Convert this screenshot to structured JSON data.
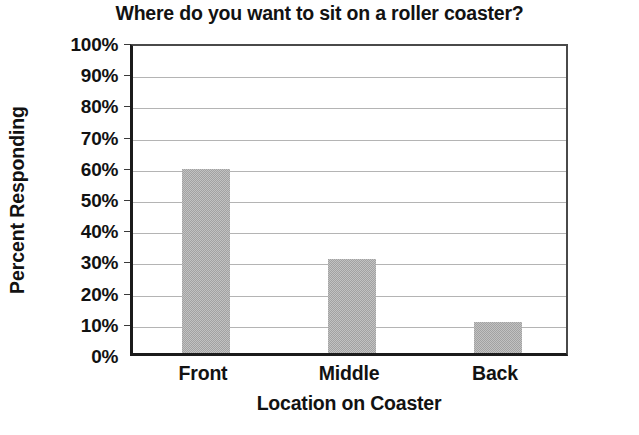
{
  "chart_data": {
    "type": "bar",
    "title": "Where do you want to sit on a roller coaster?",
    "xlabel": "Location on Coaster",
    "ylabel": "Percent Responding",
    "categories": [
      "Front",
      "Middle",
      "Back"
    ],
    "values": [
      59,
      30,
      10
    ],
    "value_labels": [
      "59%",
      "30%",
      "10%"
    ],
    "ylim": [
      0,
      100
    ],
    "ytick_step": 10,
    "ytick_labels": [
      "0%",
      "10%",
      "20%",
      "30%",
      "40%",
      "50%",
      "60%",
      "70%",
      "80%",
      "90%",
      "100%"
    ],
    "ytick_values": [
      0,
      10,
      20,
      30,
      40,
      50,
      60,
      70,
      80,
      90,
      100
    ],
    "grid": true,
    "grid_axis": "y",
    "legend": null,
    "bar_color": "#a2a2a2",
    "grid_color": "#b4b4b4",
    "axis_color": "#1b1b1b",
    "text_color": "#121212",
    "background_color": "#ffffff"
  }
}
